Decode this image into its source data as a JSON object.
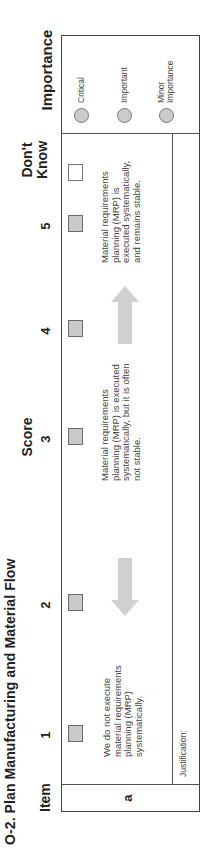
{
  "title": "O-2.  Plan Manufacturing and Material Flow",
  "headers": {
    "item": "Item",
    "score": "Score",
    "dont_know": "Don't\nKnow",
    "dont_know_line1": "Don't",
    "dont_know_line2": "Know",
    "importance": "Importance"
  },
  "score_columns": [
    "1",
    "2",
    "3",
    "4",
    "5"
  ],
  "rows": [
    {
      "item": "a",
      "descriptions": {
        "score_1": "We do not execute material requirements planning (MRP) systematically.",
        "score_3": "Material requirements planning (MRP) is executed systematically, but it is often not stable.",
        "score_5": "Material requirements planning (MRP) is executed systematically, and remains stable."
      },
      "arrows": [
        {
          "between": "2",
          "direction": "toward-1"
        },
        {
          "between": "4",
          "direction": "toward-5"
        }
      ],
      "justification_label": "Justification:"
    }
  ],
  "importance_options": [
    {
      "label": "Critical"
    },
    {
      "label": "Important"
    },
    {
      "label": "Minor Importance",
      "line1": "Minor",
      "line2": "Importance"
    }
  ],
  "colors": {
    "checkbox_fill": "#c9c9c9",
    "arrow_fill": "#d0d0d0",
    "border": "#444444"
  }
}
